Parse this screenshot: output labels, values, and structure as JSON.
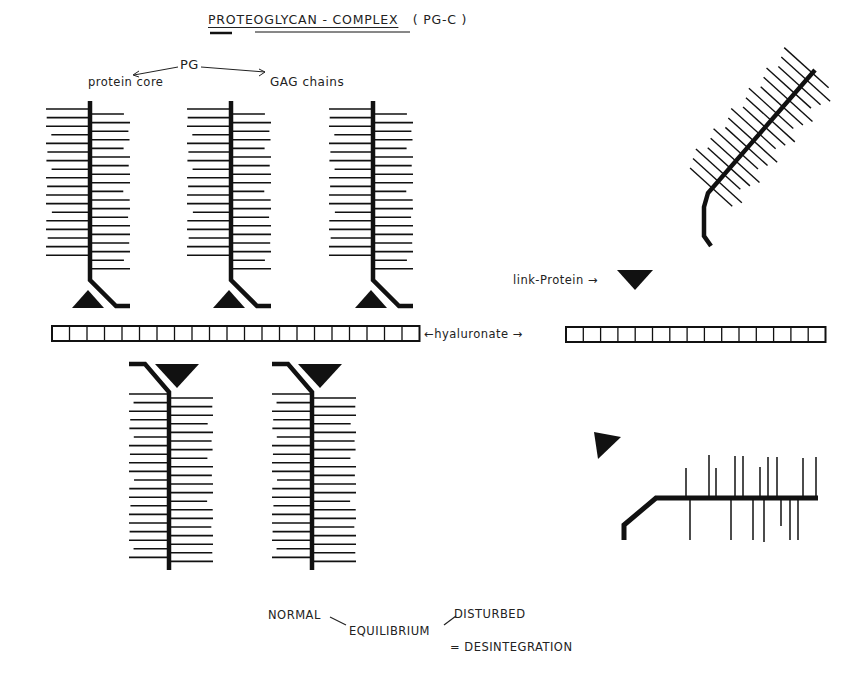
{
  "title": {
    "main": "PROTEOGLYCAN - COMPLEX",
    "abbrev": "( PG-C )"
  },
  "legend": {
    "pg": "PG",
    "protein_core": "protein core",
    "gag_chains": "GAG chains"
  },
  "labels": {
    "hyaluronate": "←hyaluronate →",
    "link_protein": "link-Protein →"
  },
  "equilibrium": {
    "normal": "NORMAL",
    "equilibrium": "EQUILIBRIUM",
    "disturbed": "DISTURBED",
    "result": "= DESINTEGRATION"
  },
  "structure": {
    "left_hyaluronate_segments": 21,
    "right_hyaluronate_segments": 15,
    "upper_proteoglycans": 3,
    "lower_proteoglycans": 2,
    "colors": {
      "ink": "#111111",
      "background": "#ffffff"
    }
  }
}
